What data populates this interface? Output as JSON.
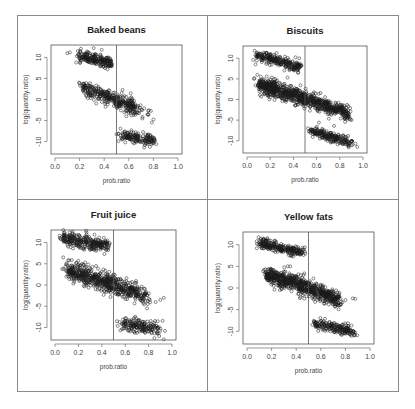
{
  "chart_data": [
    {
      "type": "scatter",
      "title": "Baked beans",
      "xlabel": "prob.ratio",
      "ylabel": "log(quantity.ratio)",
      "xlim": [
        0.0,
        1.0
      ],
      "ylim": [
        -12,
        12
      ],
      "xticks": [
        "0.0",
        "0.2",
        "0.4",
        "0.6",
        "0.8",
        "1.0"
      ],
      "yticks": [
        "10",
        "5",
        "0",
        "-5",
        "-10"
      ],
      "vline": 0.5,
      "clusters": [
        {
          "x0": 0.19,
          "x1": 0.46,
          "y0": 10.5,
          "y1": 8.5,
          "spread": 0.7,
          "n": 220
        },
        {
          "x0": 0.22,
          "x1": 0.65,
          "y0": 3.0,
          "y1": -1.8,
          "spread": 0.9,
          "n": 320
        },
        {
          "x0": 0.55,
          "x1": 0.78,
          "y0": -1.5,
          "y1": -3.2,
          "spread": 0.8,
          "n": 40
        },
        {
          "x0": 0.52,
          "x1": 0.8,
          "y0": -8.5,
          "y1": -9.8,
          "spread": 0.7,
          "n": 160
        }
      ],
      "outliers": [
        [
          0.1,
          11.0
        ],
        [
          0.12,
          11.2
        ],
        [
          0.38,
          11.8
        ],
        [
          0.58,
          -4.0
        ],
        [
          0.62,
          -3.8
        ]
      ]
    },
    {
      "type": "scatter",
      "title": "Biscuits",
      "xlabel": "prob.ratio",
      "ylabel": "log(quantity.ratio)",
      "xlim": [
        0.0,
        1.0
      ],
      "ylim": [
        -12,
        12
      ],
      "xticks": [
        "0.0",
        "0.2",
        "0.4",
        "0.6",
        "0.8",
        "1.0"
      ],
      "yticks": [
        "10",
        "5",
        "0",
        "-5",
        "-10"
      ],
      "vline": 0.5,
      "clusters": [
        {
          "x0": 0.08,
          "x1": 0.46,
          "y0": 10.8,
          "y1": 7.8,
          "spread": 0.6,
          "n": 260
        },
        {
          "x0": 0.1,
          "x1": 0.5,
          "y0": 3.6,
          "y1": 0.2,
          "spread": 1.0,
          "n": 520
        },
        {
          "x0": 0.5,
          "x1": 0.88,
          "y0": 0.2,
          "y1": -3.5,
          "spread": 0.9,
          "n": 360
        },
        {
          "x0": 0.55,
          "x1": 0.9,
          "y0": -7.6,
          "y1": -10.5,
          "spread": 0.6,
          "n": 220
        }
      ],
      "outliers": [
        [
          0.06,
          5.0
        ],
        [
          0.09,
          6.0
        ],
        [
          0.35,
          5.3
        ],
        [
          0.45,
          10.0
        ],
        [
          0.62,
          -5.6
        ],
        [
          0.75,
          -6.4
        ],
        [
          0.95,
          -11.5
        ]
      ]
    },
    {
      "type": "scatter",
      "title": "Fruit juice",
      "xlabel": "prob.ratio",
      "ylabel": "log(quantity.ratio)",
      "xlim": [
        0.0,
        1.0
      ],
      "ylim": [
        -12,
        12
      ],
      "xticks": [
        "0.0",
        "0.2",
        "0.4",
        "0.6",
        "0.8",
        "1.0"
      ],
      "yticks": [
        "10",
        "5",
        "0",
        "-5",
        "-10"
      ],
      "vline": 0.5,
      "clusters": [
        {
          "x0": 0.06,
          "x1": 0.46,
          "y0": 11.2,
          "y1": 9.2,
          "spread": 0.8,
          "n": 280
        },
        {
          "x0": 0.1,
          "x1": 0.5,
          "y0": 3.5,
          "y1": 0.0,
          "spread": 1.1,
          "n": 420
        },
        {
          "x0": 0.5,
          "x1": 0.8,
          "y0": 0.0,
          "y1": -2.8,
          "spread": 1.0,
          "n": 220
        },
        {
          "x0": 0.56,
          "x1": 0.9,
          "y0": -9.2,
          "y1": -10.2,
          "spread": 0.8,
          "n": 180
        }
      ],
      "outliers": [
        [
          0.07,
          6.5
        ],
        [
          0.04,
          11.6
        ],
        [
          0.86,
          -4.0
        ],
        [
          0.9,
          -3.5
        ],
        [
          0.93,
          -3.0
        ],
        [
          0.85,
          -12.5
        ],
        [
          0.93,
          -12.8
        ],
        [
          0.94,
          -10.8
        ]
      ]
    },
    {
      "type": "scatter",
      "title": "Yellow fats",
      "xlabel": "prob.ratio",
      "ylabel": "log(quantity.ratio)",
      "xlim": [
        0.0,
        1.0
      ],
      "ylim": [
        -12,
        12
      ],
      "xticks": [
        "0.0",
        "0.2",
        "0.4",
        "0.6",
        "0.8",
        "1.0"
      ],
      "yticks": [
        "10",
        "5",
        "0",
        "-5",
        "-10"
      ],
      "vline": 0.5,
      "clusters": [
        {
          "x0": 0.1,
          "x1": 0.46,
          "y0": 10.4,
          "y1": 8.0,
          "spread": 0.6,
          "n": 260
        },
        {
          "x0": 0.15,
          "x1": 0.5,
          "y0": 3.2,
          "y1": 0.0,
          "spread": 1.0,
          "n": 460
        },
        {
          "x0": 0.5,
          "x1": 0.76,
          "y0": 0.0,
          "y1": -3.0,
          "spread": 0.9,
          "n": 280
        },
        {
          "x0": 0.55,
          "x1": 0.88,
          "y0": -8.2,
          "y1": -10.2,
          "spread": 0.6,
          "n": 200
        }
      ],
      "outliers": [
        [
          0.08,
          10.8
        ],
        [
          0.46,
          3.0
        ],
        [
          0.54,
          2.2
        ],
        [
          0.8,
          -2.8
        ],
        [
          0.86,
          -2.4
        ],
        [
          0.88,
          -2.5
        ]
      ]
    }
  ],
  "layout": {
    "panels": [
      {
        "left": 51,
        "top": 45,
        "right": 182,
        "bottom": 154
      },
      {
        "left": 243,
        "top": 46,
        "right": 367,
        "bottom": 153
      },
      {
        "left": 51,
        "top": 230,
        "right": 176,
        "bottom": 340
      },
      {
        "left": 243,
        "top": 232,
        "right": 374,
        "bottom": 344
      }
    ],
    "point_color": "#1a1a1a",
    "axis_color": "#555555"
  }
}
